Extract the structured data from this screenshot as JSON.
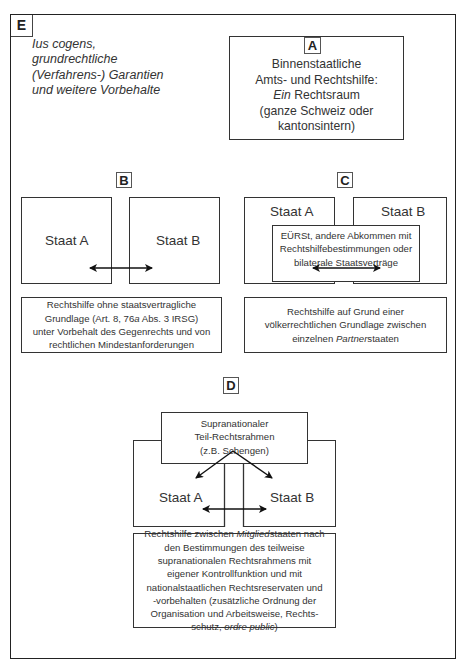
{
  "diagram": {
    "panel_e": {
      "label": "E",
      "lines": [
        "Ius cogens,",
        "grundrechtliche",
        "(Verfahrens-) Garantien",
        "und weitere Vorbehalte"
      ]
    },
    "panel_a": {
      "label": "A",
      "line1": "Binnenstaatliche",
      "line2": "Amts- und Rechtshilfe:",
      "line3_italic": "Ein",
      "line3_rest": " Rechtsraum",
      "line4": "(ganze Schweiz oder",
      "line5": "kantonsintern)"
    },
    "panel_b": {
      "label": "B",
      "state_a": "Staat A",
      "state_b": "Staat B",
      "caption": {
        "line1": "Rechtshilfe ohne staatsvertragliche",
        "line2_pre": "Grundlage (Art. 8, 76",
        "line2_italic": "a",
        "line2_post": " Abs. 3 IRSG)",
        "line3": "unter Vorbehalt des Gegenrechts und von",
        "line4": "rechtlichen Mindestanforderungen"
      }
    },
    "panel_c": {
      "label": "C",
      "state_a": "Staat A",
      "state_b": "Staat B",
      "treaty_box": {
        "line1": "EÜRSt, andere Abkommen mit",
        "line2": "Rechtshilfebestimmungen oder",
        "line3": "bilaterale Staatsverträge"
      },
      "caption": {
        "line1": "Rechtshilfe auf Grund einer",
        "line2": "völkerrechtlichen Grundlage zwischen",
        "line3_pre": "einzelnen ",
        "line3_italic": "Partner",
        "line3_post": "staaten"
      }
    },
    "panel_d": {
      "label": "D",
      "state_a": "Staat A",
      "state_b": "Staat B",
      "supranational_box": {
        "line1": "Supranationaler",
        "line2": "Teil-Rechtsrahmen",
        "line3": "(z.B. Schengen)"
      },
      "caption": {
        "line1_pre": "Rechtshilfe zwischen ",
        "line1_italic": "Mitglied",
        "line1_post": "staaten nach",
        "line2": "den Bestimmungen des teilweise",
        "line3": "supranationalen Rechtsrahmens mit",
        "line4": "eigener Kontrollfunktion und mit",
        "line5": "nationalstaatlichen Rechtsreservaten und",
        "line6": "-vorbehalten (zusätzliche Ordnung der",
        "line7": "Organisation und Arbeitsweise, Rechts-",
        "line8_pre": "schutz, ",
        "line8_italic": "ordre public",
        "line8_post": ")"
      }
    },
    "colors": {
      "line": "#333333",
      "text": "#333333",
      "background": "#ffffff"
    }
  }
}
